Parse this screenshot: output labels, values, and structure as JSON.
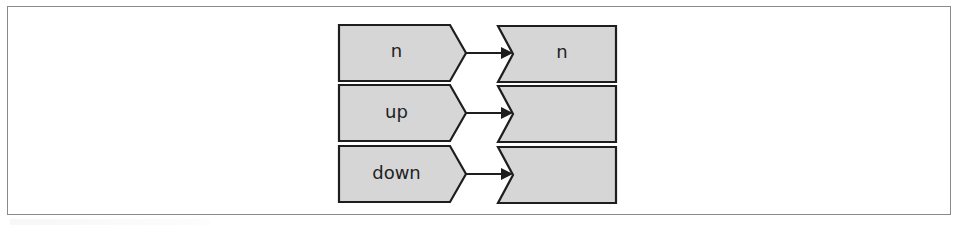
{
  "diagram": {
    "type": "port-mapping",
    "colors": {
      "shape_fill": "#d6d6d6",
      "stroke": "#1e1e1e",
      "frame": "#8a8a8a",
      "text": "#222222"
    },
    "rows": [
      {
        "source_label": "n",
        "target_label": "n"
      },
      {
        "source_label": "up",
        "target_label": ""
      },
      {
        "source_label": "down",
        "target_label": ""
      }
    ]
  }
}
